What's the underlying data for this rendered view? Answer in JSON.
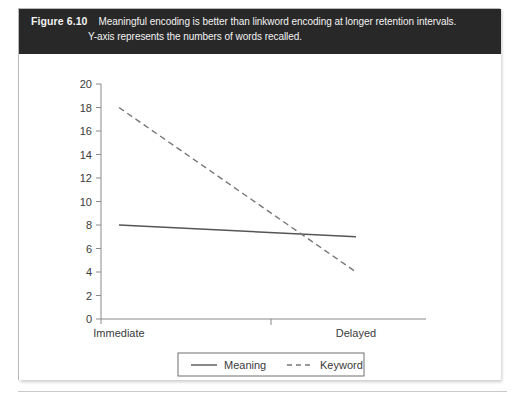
{
  "figure": {
    "number_label": "Figure 6.10",
    "caption_line_1": "Meaningful encoding is better than linkword encoding at longer retention intervals.",
    "caption_line_2": "Y-axis represents the numbers of words recalled.",
    "header_background": "#282828",
    "header_text_color": "#f2f2f2"
  },
  "chart_data": {
    "type": "line",
    "title": "",
    "xlabel": "",
    "ylabel": "",
    "categories": [
      "Immediate",
      "Delayed"
    ],
    "ylim": [
      0,
      20
    ],
    "ytick_step": 2,
    "yticks": [
      "0",
      "2",
      "4",
      "6",
      "8",
      "10",
      "12",
      "14",
      "16",
      "18",
      "20"
    ],
    "grid": false,
    "legend_position": "bottom-center",
    "series": [
      {
        "name": "Meaning",
        "style": "solid",
        "color": "#555555",
        "values": [
          8,
          7
        ]
      },
      {
        "name": "Keyword",
        "style": "dashed",
        "color": "#777777",
        "values": [
          18,
          4
        ]
      }
    ]
  }
}
